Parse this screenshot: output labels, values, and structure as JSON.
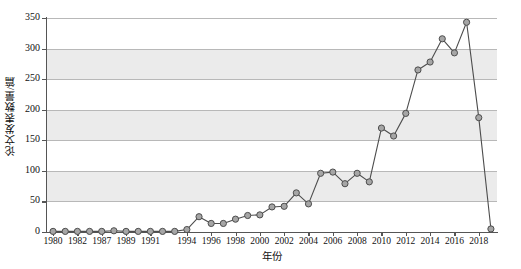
{
  "chart_data": {
    "type": "line",
    "title": "",
    "xlabel": "年份",
    "ylabel": "论文发表数量/篇",
    "xlim": [
      1980,
      2019
    ],
    "ylim": [
      0,
      350
    ],
    "ytick_values": [
      0,
      50,
      100,
      150,
      200,
      250,
      300,
      350
    ],
    "ytick_labels": [
      "0",
      "50",
      "100",
      "150",
      "200",
      "250",
      "300",
      "350"
    ],
    "xtick_labels": [
      "1980",
      "1982",
      "1987",
      "1989",
      "1991",
      "1994",
      "1996",
      "1998",
      "2000",
      "2002",
      "2004",
      "2006",
      "2008",
      "2010",
      "2012",
      "2014",
      "2016",
      "2018"
    ],
    "xtick_years": [
      1980,
      1982,
      1987,
      1989,
      1991,
      1994,
      1996,
      1998,
      2000,
      2002,
      2004,
      2006,
      2008,
      2010,
      2012,
      2014,
      2016,
      2018
    ],
    "grid": true,
    "legend": "none",
    "marker": "circle",
    "series": [
      {
        "name": "论文发表数量",
        "x": [
          1980,
          1981,
          1982,
          1983,
          1987,
          1988,
          1989,
          1990,
          1991,
          1992,
          1993,
          1994,
          1995,
          1996,
          1997,
          1998,
          1999,
          2000,
          2001,
          2002,
          2003,
          2004,
          2005,
          2006,
          2007,
          2008,
          2009,
          2010,
          2011,
          2012,
          2013,
          2014,
          2015,
          2016,
          2017,
          2018,
          2019
        ],
        "values": [
          1,
          1,
          1,
          1,
          1,
          2,
          1,
          1,
          1,
          1,
          1,
          4,
          25,
          14,
          14,
          21,
          27,
          28,
          41,
          42,
          64,
          46,
          96,
          98,
          79,
          96,
          82,
          170,
          157,
          194,
          265,
          278,
          316,
          293,
          343,
          187,
          5
        ]
      }
    ]
  }
}
